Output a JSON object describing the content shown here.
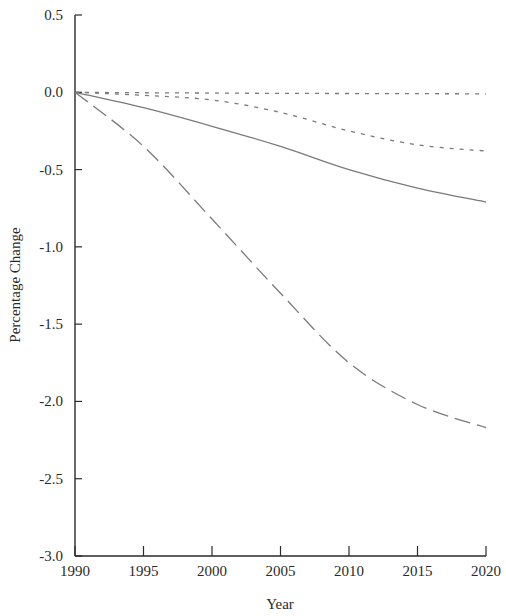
{
  "chart_data": {
    "type": "line",
    "title": "",
    "xlabel": "Year",
    "ylabel": "Percentage Change",
    "xlim": [
      1990,
      2020
    ],
    "ylim": [
      -3.0,
      0.5
    ],
    "x_ticks": [
      "1990",
      "1995",
      "2000",
      "2005",
      "2010",
      "2015",
      "2020"
    ],
    "y_ticks": [
      "0.5",
      "0.0",
      "-0.5",
      "-1.0",
      "-1.5",
      "-2.0",
      "-2.5",
      "-3.0"
    ],
    "grid": false,
    "legend": null,
    "x": [
      1990,
      1995,
      2000,
      2005,
      2010,
      2015,
      2020
    ],
    "series": [
      {
        "name": "dotted",
        "style": "dotted",
        "values": [
          0.0,
          -0.003,
          -0.005,
          -0.007,
          -0.008,
          -0.009,
          -0.01
        ]
      },
      {
        "name": "short-dash",
        "style": "short-dash",
        "values": [
          0.0,
          -0.02,
          -0.05,
          -0.13,
          -0.25,
          -0.34,
          -0.38
        ]
      },
      {
        "name": "solid",
        "style": "solid",
        "values": [
          0.0,
          -0.1,
          -0.22,
          -0.35,
          -0.5,
          -0.62,
          -0.71
        ]
      },
      {
        "name": "long-dash",
        "style": "long-dash",
        "values": [
          0.0,
          -0.35,
          -0.82,
          -1.3,
          -1.75,
          -2.02,
          -2.17
        ]
      }
    ]
  },
  "colors": {
    "axis": "#2a2a2a",
    "lines": "#7a7a7a"
  }
}
